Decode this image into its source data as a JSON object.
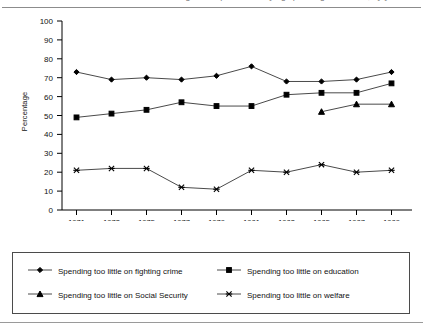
{
  "title": {
    "clipped_text": "Percentage of respondents saying spending is too little, by year"
  },
  "axes": {
    "ylabel": "Percentage",
    "yticks": [
      "0",
      "10",
      "20",
      "30",
      "40",
      "50",
      "60",
      "70",
      "80",
      "90",
      "100"
    ],
    "xticks": [
      "1971",
      "1973",
      "1975",
      "1977",
      "1979",
      "1981",
      "1983",
      "1985",
      "1987",
      "1989"
    ]
  },
  "legend": {
    "items": [
      {
        "label": "Spending too little on fighting crime",
        "marker": "diamond-marker-icon"
      },
      {
        "label": "Spending too little on education",
        "marker": "square-marker-icon"
      },
      {
        "label": "Spending too little on Social Security",
        "marker": "triangle-marker-icon"
      },
      {
        "label": "Spending too little on welfare",
        "marker": "cross-marker-icon"
      }
    ]
  },
  "chart_data": {
    "type": "line",
    "title": "Percentage of respondents saying spending is too little, by year",
    "xlabel": "",
    "ylabel": "Percentage",
    "x": [
      1971,
      1973,
      1975,
      1977,
      1979,
      1981,
      1983,
      1985,
      1987,
      1989
    ],
    "categories": [
      "1971",
      "1973",
      "1975",
      "1977",
      "1979",
      "1981",
      "1983",
      "1985",
      "1987",
      "1989"
    ],
    "ylim": [
      0,
      100
    ],
    "ytick_step": 10,
    "grid": false,
    "legend_position": "bottom",
    "series": [
      {
        "name": "Spending too little on fighting crime",
        "marker": "diamond",
        "color": "#000000",
        "values": [
          73,
          69,
          70,
          69,
          71,
          76,
          68,
          68,
          69,
          73
        ]
      },
      {
        "name": "Spending too little on education",
        "marker": "square",
        "color": "#000000",
        "values": [
          49,
          51,
          53,
          57,
          55,
          55,
          61,
          62,
          62,
          67
        ]
      },
      {
        "name": "Spending too little on Social Security",
        "marker": "triangle",
        "color": "#000000",
        "values": [
          null,
          null,
          null,
          null,
          null,
          null,
          null,
          52,
          56,
          56
        ]
      },
      {
        "name": "Spending too little on welfare",
        "marker": "cross",
        "color": "#000000",
        "values": [
          21,
          22,
          22,
          12,
          11,
          21,
          20,
          24,
          20,
          21
        ]
      }
    ]
  }
}
